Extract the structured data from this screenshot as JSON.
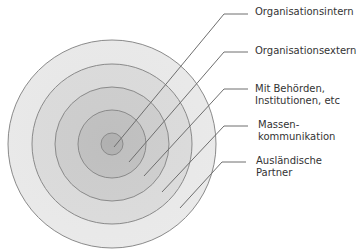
{
  "diagram": {
    "type": "concentric-circles",
    "center": [
      112,
      144
    ],
    "rings": [
      {
        "id": "auslaendische-partner",
        "radius": 104,
        "fill": "#e6e6e6"
      },
      {
        "id": "massenkommunikation",
        "radius": 80,
        "fill": "#d9d9d9"
      },
      {
        "id": "behoerden",
        "radius": 57,
        "fill": "#cccccc"
      },
      {
        "id": "organisationsextern",
        "radius": 34,
        "fill": "#bfbfbf"
      },
      {
        "id": "organisationsintern",
        "radius": 11,
        "fill": "#b0b0b0"
      }
    ],
    "stroke_color": "#8a8a8a",
    "leader_color": "#6e6e6e"
  },
  "labels": [
    {
      "id": "organisationsintern",
      "lines": [
        "Organisationsintern"
      ],
      "x": 255,
      "y": 6,
      "anchor": [
        114,
        147
      ],
      "elbow": [
        224,
        14
      ],
      "end": [
        248,
        14
      ]
    },
    {
      "id": "organisationsextern",
      "lines": [
        "Organisationsextern"
      ],
      "x": 255,
      "y": 45,
      "anchor": [
        129,
        162
      ],
      "elbow": [
        224,
        52
      ],
      "end": [
        248,
        52
      ]
    },
    {
      "id": "behoerden",
      "lines": [
        "Mit Behörden,",
        "Institutionen, etc"
      ],
      "x": 255,
      "y": 83,
      "anchor": [
        144,
        176
      ],
      "elbow": [
        224,
        89
      ],
      "end": [
        248,
        89
      ]
    },
    {
      "id": "massenkommunikation",
      "lines": [
        "Massen-",
        "kommunikation"
      ],
      "x": 258,
      "y": 119,
      "anchor": [
        162,
        192
      ],
      "elbow": [
        224,
        126
      ],
      "end": [
        248,
        126
      ]
    },
    {
      "id": "auslaendische-partner",
      "lines": [
        "Ausländische",
        "Partner"
      ],
      "x": 256,
      "y": 155,
      "anchor": [
        180,
        208
      ],
      "elbow": [
        222,
        162
      ],
      "end": [
        246,
        162
      ]
    }
  ]
}
